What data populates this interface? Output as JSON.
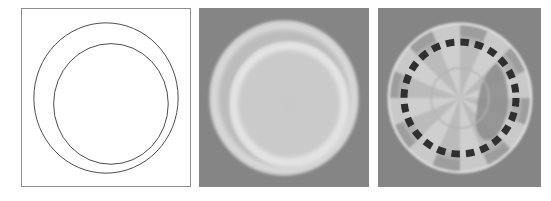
{
  "figure": {
    "title": "Three-panel annulus comparison",
    "panel_count": 3,
    "background_color": "#ffffff",
    "width_px": 551,
    "height_px": 201
  },
  "panels": [
    {
      "id": "schematic",
      "name": "outline-schematic",
      "label": "a",
      "description": "Line drawing of two offset concentric circles on white background",
      "background_color": "#ffffff",
      "border_color": "#8d8d8d",
      "stroke_color": "#4a4a4a",
      "stroke_width": 1,
      "outer_circle": {
        "cx": 85,
        "cy": 90,
        "rx": 73,
        "ry": 76
      },
      "inner_circle": {
        "cx": 90,
        "cy": 96,
        "rx": 58,
        "ry": 61
      }
    },
    {
      "id": "grayscale",
      "name": "grayscale-intensity-map",
      "label": "b",
      "description": "Grayscale intensity map of annulus with bright rim and light inner disc",
      "background_color": "#858585",
      "outer_disc_color": "#b4b4b4",
      "outer_rim_color": "#d7d7d7",
      "inner_disc_color": "#c6c6c6",
      "inner_rim_color": "#e4e4e4",
      "outer_circle": {
        "cx": 85,
        "cy": 90,
        "rx": 73,
        "ry": 76
      },
      "inner_circle": {
        "cx": 90,
        "cy": 96,
        "rx": 58,
        "ry": 61
      }
    },
    {
      "id": "segmented",
      "name": "sector-segmentation-overlay",
      "label": "c",
      "description": "Checkerboard sector segmentation of annulus with dashed boundary ring overlay",
      "background_color": "#858585",
      "disc_color": "#cfcfcf",
      "rim_color": "#dedede",
      "sector_light_color": "#c9c9c9",
      "sector_dark_color": "#9d9d9d",
      "defect_color": "#8f8f8f",
      "dashed_ring_color": "#2f2f2f",
      "dash_count": 24,
      "dash_width": 7,
      "sector_count": 16,
      "outer_circle": {
        "cx": 82,
        "cy": 90,
        "rx": 72,
        "ry": 75
      },
      "dashed_ring": {
        "cx": 82,
        "cy": 90,
        "r": 56
      },
      "inner_circle": {
        "cx": 82,
        "cy": 90,
        "rx": 29,
        "ry": 30
      }
    }
  ],
  "chart_data": {
    "type": "heatmap",
    "xlabel": "",
    "ylabel": "",
    "categories": [
      "schematic",
      "grayscale",
      "segmented"
    ],
    "series": [
      {
        "name": "background_intensity",
        "values": [
          255,
          133,
          133
        ]
      },
      {
        "name": "outer_ring_intensity",
        "values": [
          255,
          180,
          222
        ]
      },
      {
        "name": "inner_disc_intensity",
        "values": [
          255,
          198,
          207
        ]
      },
      {
        "name": "overlay_intensity",
        "values": [
          74,
          228,
          47
        ]
      }
    ],
    "legend_position": "none",
    "grid": false
  }
}
